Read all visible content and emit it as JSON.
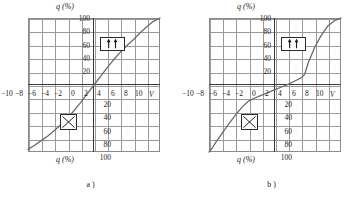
{
  "page": {
    "background": "#ffffff",
    "axis_color": "#3a3a3a",
    "grid_color": "#9a9a9a",
    "curve_color": "#6b6b6b"
  },
  "figures": [
    {
      "id": "a",
      "caption": "a )",
      "top_axis_label": "q (%)",
      "bottom_axis_label": "q (%)",
      "x_unit": "V",
      "y_ticks_positive": [
        "100",
        "80",
        "60",
        "40",
        "20"
      ],
      "y_ticks_negative": [
        "20",
        "40",
        "60",
        "80",
        "100"
      ],
      "x_ticks": [
        "−10",
        "−8",
        "−6",
        "−4",
        "−2",
        "0",
        "2",
        "4",
        "6",
        "8",
        "10"
      ],
      "icons": {
        "arrows": "parallel-up-arrows-icon",
        "cross": "crossed-box-icon"
      },
      "chart_data": {
        "type": "line",
        "title": "",
        "xlabel": "V",
        "ylabel": "q (%)",
        "xlim": [
          -10,
          10
        ],
        "ylim": [
          -100,
          100
        ],
        "grid": true,
        "legend": "none",
        "x": [
          -10,
          -9,
          -8,
          -7,
          -6,
          -5,
          -4,
          -3,
          -2,
          -1,
          0,
          1,
          2,
          3,
          4,
          5,
          6,
          7,
          8,
          9,
          10
        ],
        "y": [
          -96,
          -90,
          -83,
          -76,
          -68,
          -59,
          -49,
          -38,
          -26,
          -13,
          0,
          13,
          26,
          38,
          49,
          59,
          68,
          78,
          87,
          95,
          100
        ]
      }
    },
    {
      "id": "b",
      "caption": "b )",
      "top_axis_label": "q (%)",
      "bottom_axis_label": "q (%)",
      "x_unit": "V",
      "y_ticks_positive": [
        "100",
        "80",
        "60",
        "40",
        "20"
      ],
      "y_ticks_negative": [
        "20",
        "40",
        "60",
        "80",
        "100"
      ],
      "x_ticks": [
        "−10",
        "−8",
        "−6",
        "−4",
        "−2",
        "0",
        "2",
        "4",
        "6",
        "8",
        "10"
      ],
      "icons": {
        "arrows": "antiparallel-arrows-icon",
        "cross": "crossed-box-icon"
      },
      "chart_data": {
        "type": "line",
        "title": "",
        "xlabel": "V",
        "ylabel": "q (%)",
        "xlim": [
          -10,
          10
        ],
        "ylim": [
          -100,
          100
        ],
        "grid": true,
        "legend": "none",
        "x": [
          -10,
          -9.5,
          -9,
          -8,
          -7,
          -6,
          -5,
          -4,
          -3,
          -2,
          -1,
          0,
          1,
          2,
          3,
          4,
          4.5,
          5,
          6,
          7,
          8,
          9,
          10
        ],
        "y": [
          -100,
          -94,
          -86,
          -72,
          -58,
          -45,
          -33,
          -24,
          -19,
          -15,
          -11,
          -7,
          -3,
          1,
          6,
          11,
          16,
          32,
          56,
          74,
          88,
          96,
          100
        ]
      }
    }
  ]
}
